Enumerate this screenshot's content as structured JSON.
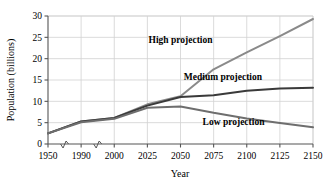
{
  "chart_data": {
    "type": "line",
    "title": "",
    "xlabel": "Year",
    "ylabel": "Population (billions)",
    "x": [
      1950,
      1990,
      2000,
      2025,
      2050,
      2075,
      2100,
      2125,
      2150
    ],
    "xtick_labels": [
      "1950",
      "1990",
      "2000",
      "2025",
      "2050",
      "2075",
      "2100",
      "2125",
      "2150"
    ],
    "ytick_labels": [
      "0",
      "5",
      "10",
      "15",
      "20",
      "25",
      "30"
    ],
    "ylim": [
      0,
      30
    ],
    "ytick_values": [
      0,
      5,
      10,
      15,
      20,
      25,
      30
    ],
    "grid": true,
    "axis_breaks": true,
    "legend_position": "inline-annotations",
    "series": [
      {
        "name": "High projection",
        "color": "#8a8a8a",
        "values": [
          2.5,
          5.3,
          6.1,
          9.3,
          11.2,
          17.5,
          21.5,
          25.3,
          29.3
        ]
      },
      {
        "name": "Medium projection",
        "color": "#3a3a3a",
        "values": [
          2.5,
          5.3,
          6.1,
          9.0,
          11.0,
          11.4,
          12.5,
          13.0,
          13.2
        ]
      },
      {
        "name": "Low projection",
        "color": "#6e6e6e",
        "values": [
          2.5,
          5.1,
          5.9,
          8.5,
          8.8,
          7.3,
          6.0,
          4.9,
          3.9
        ]
      }
    ],
    "annotations": [
      {
        "text": "High projection",
        "x_frac": 0.5,
        "y_value": 23.6
      },
      {
        "text": "Medium projection",
        "x_frac": 0.66,
        "y_value": 15.0
      },
      {
        "text": "Low projection",
        "x_frac": 0.7,
        "y_value": 4.4
      }
    ]
  }
}
